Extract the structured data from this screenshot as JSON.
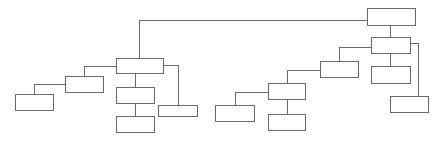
{
  "diagram": {
    "type": "tree",
    "stroke_color": "#6a6a6a",
    "background": "#ffffff",
    "nodes": [
      {
        "id": "root",
        "label": "",
        "x": 367,
        "y": 8,
        "w": 48,
        "h": 17
      },
      {
        "id": "left-parent",
        "label": "",
        "x": 116,
        "y": 58,
        "w": 47,
        "h": 15
      },
      {
        "id": "left-child-1",
        "label": "",
        "x": 65,
        "y": 76,
        "w": 38,
        "h": 16
      },
      {
        "id": "left-grandchild-1",
        "label": "",
        "x": 15,
        "y": 94,
        "w": 38,
        "h": 16
      },
      {
        "id": "left-child-2",
        "label": "",
        "x": 116,
        "y": 87,
        "w": 38,
        "h": 16
      },
      {
        "id": "left-grandchild-2",
        "label": "",
        "x": 116,
        "y": 116,
        "w": 38,
        "h": 16
      },
      {
        "id": "left-child-3",
        "label": "",
        "x": 158,
        "y": 105,
        "w": 39,
        "h": 11
      },
      {
        "id": "right-parent",
        "label": "",
        "x": 371,
        "y": 37,
        "w": 39,
        "h": 16
      },
      {
        "id": "right-child-1",
        "label": "",
        "x": 320,
        "y": 61,
        "w": 38,
        "h": 16
      },
      {
        "id": "right-grandchild-1",
        "label": "",
        "x": 268,
        "y": 83,
        "w": 37,
        "h": 16
      },
      {
        "id": "right-great-grandchild-1",
        "label": "",
        "x": 215,
        "y": 105,
        "w": 39,
        "h": 16
      },
      {
        "id": "right-great-grandchild-2",
        "label": "",
        "x": 268,
        "y": 114,
        "w": 37,
        "h": 16
      },
      {
        "id": "right-child-2",
        "label": "",
        "x": 371,
        "y": 66,
        "w": 39,
        "h": 17
      },
      {
        "id": "right-child-3",
        "label": "",
        "x": 390,
        "y": 96,
        "w": 38,
        "h": 16
      }
    ],
    "edges": [
      {
        "from": "root",
        "to": "left-parent",
        "points": [
          [
            367,
            20
          ],
          [
            139,
            20
          ],
          [
            139,
            58
          ]
        ]
      },
      {
        "from": "root",
        "to": "right-parent",
        "points": [
          [
            390,
            25
          ],
          [
            390,
            37
          ]
        ]
      },
      {
        "from": "left-parent",
        "to": "left-child-1",
        "points": [
          [
            116,
            66
          ],
          [
            84,
            66
          ],
          [
            84,
            76
          ]
        ]
      },
      {
        "from": "left-child-1",
        "to": "left-grandchild-1",
        "points": [
          [
            65,
            84
          ],
          [
            34,
            84
          ],
          [
            34,
            94
          ]
        ]
      },
      {
        "from": "left-parent",
        "to": "left-child-2",
        "points": [
          [
            135,
            73
          ],
          [
            135,
            87
          ]
        ]
      },
      {
        "from": "left-child-2",
        "to": "left-grandchild-2",
        "points": [
          [
            135,
            103
          ],
          [
            135,
            116
          ]
        ]
      },
      {
        "from": "left-parent",
        "to": "left-child-3",
        "points": [
          [
            163,
            65
          ],
          [
            178,
            65
          ],
          [
            178,
            105
          ]
        ]
      },
      {
        "from": "right-parent",
        "to": "right-child-1",
        "points": [
          [
            371,
            47
          ],
          [
            339,
            47
          ],
          [
            339,
            61
          ]
        ]
      },
      {
        "from": "right-child-1",
        "to": "right-grandchild-1",
        "points": [
          [
            320,
            70
          ],
          [
            287,
            70
          ],
          [
            287,
            83
          ]
        ]
      },
      {
        "from": "right-grandchild-1",
        "to": "right-great-grandchild-1",
        "points": [
          [
            268,
            92
          ],
          [
            235,
            92
          ],
          [
            235,
            105
          ]
        ]
      },
      {
        "from": "right-grandchild-1",
        "to": "right-great-grandchild-2",
        "points": [
          [
            287,
            99
          ],
          [
            287,
            114
          ]
        ]
      },
      {
        "from": "right-parent",
        "to": "right-child-2",
        "points": [
          [
            390,
            53
          ],
          [
            390,
            66
          ]
        ]
      },
      {
        "from": "right-parent",
        "to": "right-child-3",
        "points": [
          [
            410,
            43
          ],
          [
            418,
            43
          ],
          [
            418,
            96
          ]
        ]
      }
    ]
  }
}
